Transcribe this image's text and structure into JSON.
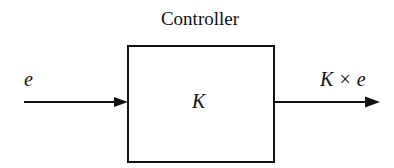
{
  "diagram": {
    "title": "Controller",
    "block": {
      "label": "K"
    },
    "input": {
      "label": "e"
    },
    "output": {
      "label": "K × e"
    },
    "colors": {
      "stroke": "#111111",
      "background": "#ffffff"
    }
  }
}
